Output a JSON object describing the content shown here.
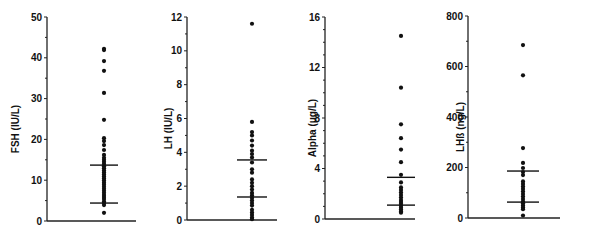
{
  "chart_data": [
    {
      "type": "scatter",
      "panel": "FSH",
      "ylabel": "FSH  (IU/L)",
      "ylim": [
        0,
        50
      ],
      "yticks": [
        0,
        10,
        20,
        30,
        40,
        50
      ],
      "minor_ticks_per_major": 2,
      "values": [
        42.2,
        41.9,
        39.2,
        36.8,
        31.4,
        24.8,
        20.3,
        19.6,
        18.6,
        17.4,
        16.2,
        15.5,
        15.0,
        14.5,
        14.0,
        13.4,
        12.9,
        12.4,
        11.9,
        11.4,
        10.9,
        10.4,
        9.9,
        9.4,
        8.9,
        8.4,
        7.9,
        7.4,
        6.9,
        6.4,
        5.9,
        5.4,
        4.8,
        4.4,
        3.9,
        2.0
      ],
      "upper_line": 13.7,
      "lower_line": 4.4,
      "grid": false
    },
    {
      "type": "scatter",
      "panel": "LH",
      "ylabel": "LH  (IU/L)",
      "ylim": [
        0,
        12
      ],
      "yticks": [
        0,
        2,
        4,
        6,
        8,
        10,
        12
      ],
      "minor_ticks_per_major": 2,
      "values": [
        11.6,
        5.8,
        5.2,
        5.0,
        4.7,
        4.4,
        4.1,
        3.9,
        3.7,
        3.4,
        3.0,
        2.8,
        2.4,
        2.2,
        2.0,
        1.8,
        1.6,
        1.45,
        1.3,
        1.15,
        1.0,
        0.85,
        0.6,
        0.45,
        0.3,
        0.15,
        0.05
      ],
      "upper_line": 3.55,
      "lower_line": 1.36,
      "grid": false
    },
    {
      "type": "scatter",
      "panel": "Alpha",
      "ylabel": "Alpha  (μg/L)",
      "ylim": [
        0,
        16
      ],
      "yticks": [
        0,
        4,
        8,
        12,
        16
      ],
      "minor_ticks_per_major": 4,
      "values": [
        14.5,
        10.4,
        7.5,
        6.4,
        5.5,
        4.5,
        3.5,
        2.9,
        2.5,
        2.3,
        2.1,
        1.9,
        1.7,
        1.5,
        1.35,
        1.2,
        1.05,
        0.9,
        0.75,
        0.6,
        0.5
      ],
      "upper_line": 3.3,
      "lower_line": 1.1,
      "grid": false
    },
    {
      "type": "scatter",
      "panel": "LHβ",
      "ylabel": "LHß  (ng/L)",
      "ylim": [
        0,
        800
      ],
      "yticks": [
        0,
        200,
        400,
        600,
        800
      ],
      "minor_ticks_per_major": 2,
      "values": [
        685,
        565,
        277,
        218,
        198,
        182,
        170,
        145,
        135,
        125,
        115,
        105,
        95,
        85,
        75,
        65,
        58,
        50,
        42,
        35,
        10
      ],
      "upper_line": 186,
      "lower_line": 63,
      "grid": false
    }
  ],
  "layout": {
    "panels": [
      {
        "axis_x": 47,
        "x_end": 136,
        "y0": 221,
        "ytop": 17,
        "data_x": 104,
        "bar_half": 13,
        "label_x": 15
      },
      {
        "axis_x": 187,
        "x_end": 277,
        "y0": 220,
        "ytop": 17,
        "data_x": 252,
        "bar_half": 14,
        "label_x": 168
      },
      {
        "axis_x": 325,
        "x_end": 415,
        "y0": 219,
        "ytop": 17,
        "data_x": 401,
        "bar_half": 13,
        "label_x": 312
      },
      {
        "axis_x": 468,
        "x_end": 560,
        "y0": 218,
        "ytop": 16,
        "data_x": 555,
        "bar_half": 15,
        "label_x": 460
      }
    ],
    "ink": "#111111",
    "background": "#ffffff"
  }
}
